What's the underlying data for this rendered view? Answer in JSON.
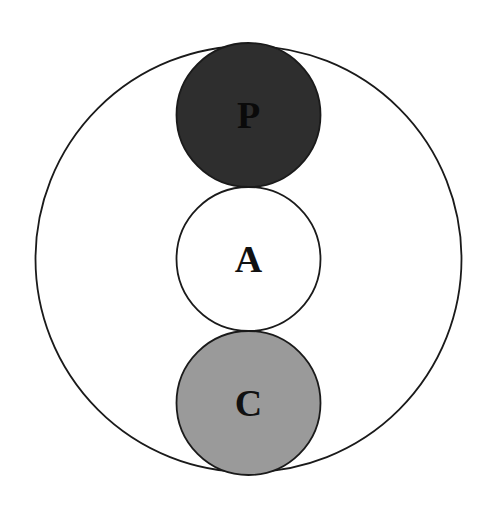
{
  "diagram": {
    "type": "nested-circles",
    "outer": {
      "cx": 248.5,
      "cy": 259,
      "r": 213,
      "fill": "#ffffff",
      "stroke": "#1a1a1a"
    },
    "circles": [
      {
        "label": "P",
        "cx": 248.5,
        "cy": 115,
        "r": 72,
        "fill": "#2e2e2e",
        "text_color": "#0a0a0a"
      },
      {
        "label": "A",
        "cx": 248.5,
        "cy": 259,
        "r": 72,
        "fill": "#ffffff",
        "text_color": "#111111"
      },
      {
        "label": "C",
        "cx": 248.5,
        "cy": 403,
        "r": 72,
        "fill": "#9a9a9a",
        "text_color": "#111111"
      }
    ]
  }
}
